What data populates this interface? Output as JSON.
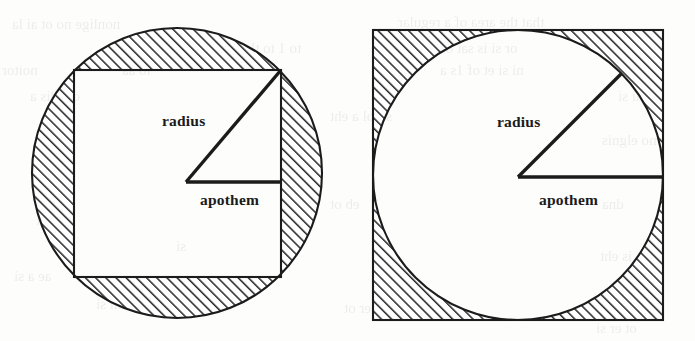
{
  "figure": {
    "width": 695,
    "height": 341,
    "background_color": "#fdfdfc",
    "stroke_color": "#1b1b1b",
    "hatch_color": "#2b2b2b",
    "fill_color": "#ffffff"
  },
  "diagrams": [
    {
      "id": "circumscribed-circle",
      "caption": "Square inscribed in a circle",
      "shaded_region": "circle-outside-square",
      "circle": {
        "cx": 177,
        "cy": 173,
        "r": 145
      },
      "square": {
        "x": 74,
        "y": 70,
        "size": 207
      },
      "vertex": {
        "x": 186,
        "y": 182
      },
      "radius_end": {
        "x": 281,
        "y": 70
      },
      "apothem_end": {
        "x": 281,
        "y": 182
      },
      "labels": {
        "radius": "radius",
        "apothem": "apothem"
      },
      "label_positions": {
        "radius": {
          "x": 162,
          "y": 126
        },
        "apothem": {
          "x": 200,
          "y": 205
        }
      }
    },
    {
      "id": "inscribed-circle",
      "caption": "Circle inscribed in a square",
      "shaded_region": "square-outside-circle",
      "circle": {
        "cx": 518,
        "cy": 175,
        "r": 145
      },
      "square": {
        "x": 373,
        "y": 30,
        "size": 290
      },
      "vertex": {
        "x": 518,
        "y": 177
      },
      "radius_end": {
        "x": 621,
        "y": 74
      },
      "apothem_end": {
        "x": 663,
        "y": 177
      },
      "labels": {
        "radius": "radius",
        "apothem": "apothem"
      },
      "label_positions": {
        "radius": {
          "x": 497,
          "y": 127
        },
        "apothem": {
          "x": 539,
          "y": 205
        }
      }
    }
  ],
  "background_artifacts": {
    "note": "faint reversed bleed-through text from the opposite page of the scan",
    "lines": [
      {
        "text": "nonlige no ot ai la",
        "x": 12,
        "y": 16,
        "size": 15
      },
      {
        "text": "that the area of a regular",
        "x": 398,
        "y": 14,
        "size": 15
      },
      {
        "text": "to 1 to tlo sr tie",
        "x": 210,
        "y": 40,
        "size": 15
      },
      {
        "text": "or si is sat otni",
        "x": 430,
        "y": 40,
        "size": 15
      },
      {
        "text": "noitor",
        "x": 2,
        "y": 62,
        "size": 15
      },
      {
        "text": "lo aa",
        "x": 122,
        "y": 62,
        "size": 15
      },
      {
        "text": "ni si et of 1s a",
        "x": 440,
        "y": 62,
        "size": 15
      },
      {
        "text": "ot edis a",
        "x": 30,
        "y": 88,
        "size": 15
      },
      {
        "text": "tni si",
        "x": 618,
        "y": 88,
        "size": 15
      },
      {
        "text": "si tol a eht",
        "x": 330,
        "y": 108,
        "size": 15
      },
      {
        "text": "mo elgnis",
        "x": 602,
        "y": 132,
        "size": 15
      },
      {
        "text": "h ni",
        "x": 46,
        "y": 178,
        "size": 15
      },
      {
        "text": "eb ot",
        "x": 330,
        "y": 196,
        "size": 15
      },
      {
        "text": "dna",
        "x": 602,
        "y": 196,
        "size": 15
      },
      {
        "text": "eht",
        "x": 36,
        "y": 212,
        "size": 15
      },
      {
        "text": "si",
        "x": 176,
        "y": 238,
        "size": 15
      },
      {
        "text": "to is eht",
        "x": 600,
        "y": 248,
        "size": 15
      },
      {
        "text": "ae a si",
        "x": 14,
        "y": 268,
        "size": 15
      },
      {
        "text": "eht ni si",
        "x": 96,
        "y": 296,
        "size": 15
      },
      {
        "text": "si eht a er ot",
        "x": 344,
        "y": 300,
        "size": 15
      },
      {
        "text": "ot er si",
        "x": 596,
        "y": 320,
        "size": 15
      }
    ]
  }
}
